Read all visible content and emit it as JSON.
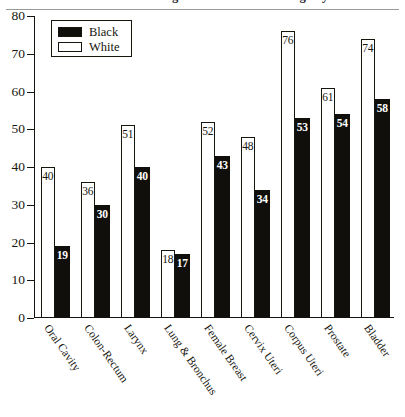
{
  "chart_data": {
    "type": "bar",
    "title": "Percent of Cancers Diagnosed at Localized Stage by Race",
    "xlabel": "",
    "ylabel": "",
    "ylim": [
      0,
      80
    ],
    "yticks": [
      0,
      10,
      20,
      30,
      40,
      50,
      60,
      70,
      80
    ],
    "grid": false,
    "legend_position": "top-left",
    "categories": [
      "Oral Cavity",
      "Colon-Rectum",
      "Larynx",
      "Lung & Bronchus",
      "Female Breast",
      "Cervix Uteri",
      "Corpus Uteri",
      "Prostate",
      "Bladder"
    ],
    "series": [
      {
        "name": "White",
        "color": "#ffffff",
        "values": [
          40,
          36,
          51,
          18,
          52,
          48,
          76,
          61,
          74
        ]
      },
      {
        "name": "Black",
        "color": "#100f0c",
        "values": [
          19,
          30,
          40,
          17,
          43,
          34,
          53,
          54,
          58
        ]
      }
    ]
  },
  "legend": {
    "items": [
      {
        "label": "Black",
        "swatch": "filled-swatch"
      },
      {
        "label": "White",
        "swatch": "hollow-swatch"
      }
    ]
  }
}
